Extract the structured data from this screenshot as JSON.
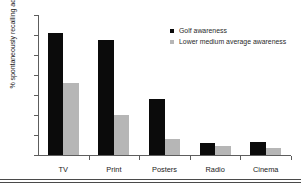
{
  "chart_data": {
    "type": "bar",
    "title": "",
    "subtitle": "",
    "xlabel": "",
    "ylabel": "% spontaneously recalling advertising",
    "ylim": [
      0,
      35
    ],
    "yticks": [
      0,
      5,
      10,
      15,
      20,
      25,
      30,
      35
    ],
    "grid": false,
    "legend_position": "top-right",
    "categories": [
      "TV",
      "Print",
      "Posters",
      "Radio",
      "Cinema"
    ],
    "series": [
      {
        "name": "Golf awareness",
        "color": "#0b0b0b",
        "values": [
          30.5,
          28.7,
          14.0,
          3.0,
          3.2
        ]
      },
      {
        "name": "Lower medium average awareness",
        "color": "#b6b6b6",
        "values": [
          18.0,
          10.0,
          4.0,
          2.2,
          1.8
        ]
      }
    ]
  }
}
